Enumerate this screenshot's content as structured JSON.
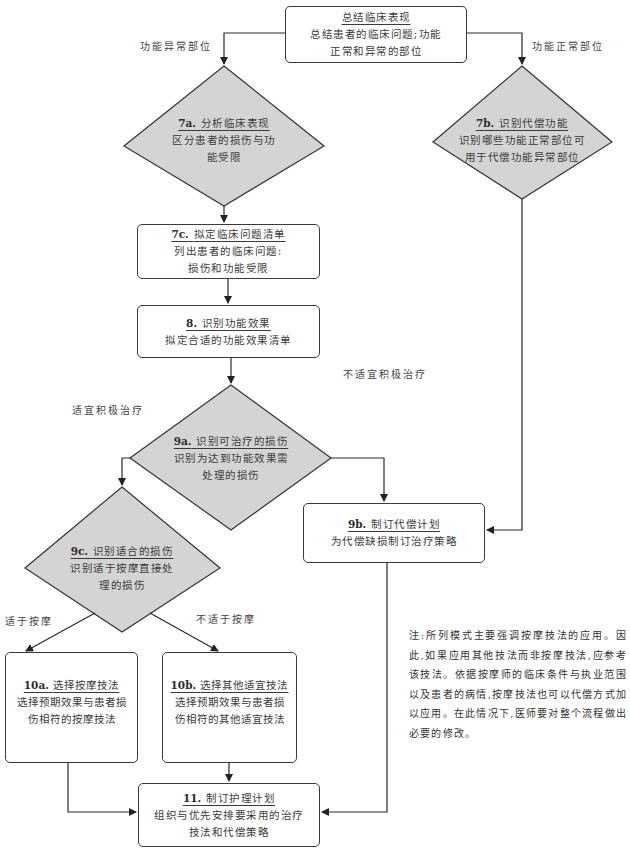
{
  "flowchart": {
    "nodes": {
      "summary": {
        "title": "总结临床表现",
        "lines": [
          "总结患者的临床问题;功能",
          "正常和异常的部位"
        ],
        "shape": "box"
      },
      "n7a": {
        "number": "7a.",
        "title": "分析临床表现",
        "lines": [
          "区分患者的损伤与功",
          "能受限"
        ],
        "shape": "diamond"
      },
      "n7b": {
        "number": "7b.",
        "title": "识别代偿功能",
        "lines": [
          "识别哪些功能正常部位可",
          "用于代偿功能异常部位"
        ],
        "shape": "diamond"
      },
      "n7c": {
        "number": "7c.",
        "title": "拟定临床问题清单",
        "lines": [
          "列出患者的临床问题:",
          "损伤和功能受限"
        ],
        "shape": "box"
      },
      "n8": {
        "number": "8.",
        "title": "识别功能效果",
        "lines": [
          "拟定合适的功能效果清单"
        ],
        "shape": "box"
      },
      "n9a": {
        "number": "9a.",
        "title": "识别可治疗的损伤",
        "lines": [
          "识别为达到功能效果需",
          "处理的损伤"
        ],
        "shape": "diamond"
      },
      "n9b": {
        "number": "9b.",
        "title": "制订代偿计划",
        "lines": [
          "为代偿缺损制订治疗策略"
        ],
        "shape": "box"
      },
      "n9c": {
        "number": "9c.",
        "title": "识别适合的损伤",
        "lines": [
          "识别适于按摩直接处",
          "理的损伤"
        ],
        "shape": "diamond"
      },
      "n10a": {
        "number": "10a.",
        "title": "选择按摩技法",
        "lines": [
          "选择预期效果与患者损",
          "伤相符的按摩技法"
        ],
        "shape": "box"
      },
      "n10b": {
        "number": "10b.",
        "title": "选择其他适宜技法",
        "lines": [
          "选择预期效果与患者损",
          "伤相符的其他适宜技法"
        ],
        "shape": "box"
      },
      "n11": {
        "number": "11.",
        "title": "制订护理计划",
        "lines": [
          "组织与优先安排要采用的治疗",
          "技法和代偿策略"
        ],
        "shape": "box"
      }
    },
    "edge_labels": {
      "abnormal": "功能异常部位",
      "normal": "功能正常部位",
      "active_ok": "适宜积极治疗",
      "active_not_ok": "不适宜积极治疗",
      "massage_ok": "适于按摩",
      "massage_not_ok": "不适于按摩"
    },
    "note": "注:所列模式主要强调按摩技法的应用。因此,如果应用其他技法而非按摩技法,应参考该技法。依据按摩师的临床条件与执业范围以及患者的病情,按摩技法也可以代偿方式加以应用。在此情况下,医师要对整个流程做出必要的修改。",
    "colors": {
      "diamond_fill": "#d4d4d4",
      "line": "#2a2a2a",
      "text": "#3a3a3a"
    }
  }
}
